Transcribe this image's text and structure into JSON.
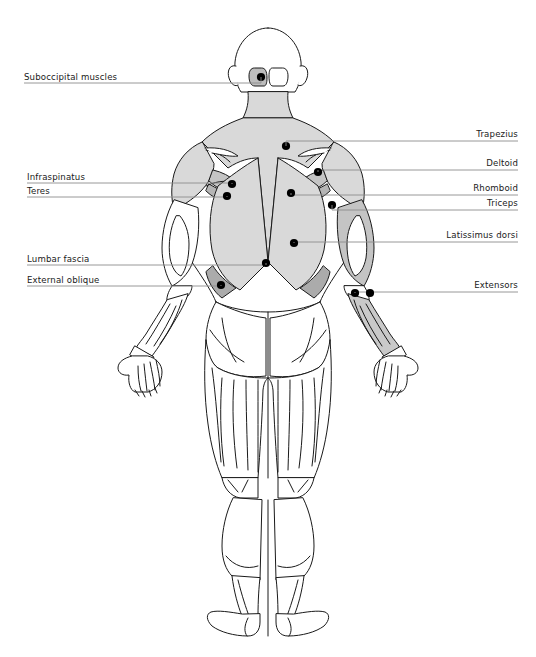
{
  "diagram": {
    "view": "posterior",
    "background_color": "#ffffff",
    "outline_color": "#1a1a1a",
    "label_color": "#1a1a1a",
    "leader_color": "#8c8c8c",
    "marker_color": "#000000",
    "fills": {
      "light_gray": "#d9d9d9",
      "mid_gray": "#c4c4c4",
      "dark_gray": "#ababab",
      "white": "#ffffff"
    }
  },
  "labels_left": [
    {
      "id": "suboccipital",
      "text": "Suboccipital muscles",
      "text_x": 24,
      "text_y": 80,
      "line_y": 83,
      "line_x1": 24,
      "line_x2": 261,
      "dot_x": 261,
      "dot_y": 77
    },
    {
      "id": "infraspinatus",
      "text": "Infraspinatus",
      "text_x": 27,
      "text_y": 180,
      "line_y": 183,
      "line_x1": 27,
      "line_x2": 232,
      "dot_x": 232,
      "dot_y": 184
    },
    {
      "id": "teres",
      "text": "Teres",
      "text_x": 27,
      "text_y": 194,
      "line_y": 197,
      "line_x1": 27,
      "line_x2": 227,
      "dot_x": 227,
      "dot_y": 196
    },
    {
      "id": "lumbar-fascia",
      "text": "Lumbar fascia",
      "text_x": 27,
      "text_y": 262,
      "line_y": 265,
      "line_x1": 27,
      "line_x2": 266,
      "dot_x": 266,
      "dot_y": 263
    },
    {
      "id": "external-oblique",
      "text": "External oblique",
      "text_x": 27,
      "text_y": 283,
      "line_y": 286,
      "line_x1": 27,
      "line_x2": 221,
      "dot_x": 221,
      "dot_y": 285
    }
  ],
  "labels_right": [
    {
      "id": "trapezius",
      "text": "Trapezius",
      "text_x": 518,
      "text_y": 137,
      "line_y": 141,
      "line_x1": 286,
      "line_x2": 518,
      "dot_x": 286,
      "dot_y": 146
    },
    {
      "id": "deltoid",
      "text": "Deltoid",
      "text_x": 518,
      "text_y": 166,
      "line_y": 170,
      "line_x1": 318,
      "line_x2": 518,
      "dot_x": 318,
      "dot_y": 172
    },
    {
      "id": "rhomboid",
      "text": "Rhomboid",
      "text_x": 518,
      "text_y": 191,
      "line_y": 195,
      "line_x1": 291,
      "line_x2": 518,
      "dot_x": 291,
      "dot_y": 193
    },
    {
      "id": "triceps",
      "text": "Triceps",
      "text_x": 518,
      "text_y": 206,
      "line_y": 210,
      "line_x1": 332,
      "line_x2": 518,
      "dot_x": 332,
      "dot_y": 205
    },
    {
      "id": "latissimus-dorsi",
      "text": "Latissimus dorsi",
      "text_x": 518,
      "text_y": 238,
      "line_y": 242,
      "line_x1": 294,
      "line_x2": 518,
      "dot_x": 294,
      "dot_y": 243
    },
    {
      "id": "extensors",
      "text": "Extensors",
      "text_x": 518,
      "text_y": 288,
      "line_y": 292,
      "line_x1": 355,
      "line_x2": 518,
      "dot_x": 355,
      "dot_y": 293,
      "dot2_x": 370,
      "dot2_y": 293
    }
  ]
}
